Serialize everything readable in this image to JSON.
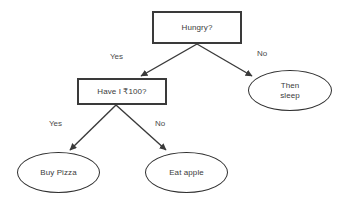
{
  "diagram": {
    "type": "decision-flowchart",
    "background_color": "#ffffff",
    "stroke_color": "#3a3a3a",
    "text_color": "#3b3b3b",
    "nodes": [
      {
        "id": "hungry",
        "shape": "rectangle",
        "label": "Hungry?"
      },
      {
        "id": "money",
        "shape": "rectangle",
        "label": "Have I ₹100?"
      },
      {
        "id": "sleep",
        "shape": "ellipse",
        "label": "Then\nsleep"
      },
      {
        "id": "pizza",
        "shape": "ellipse",
        "label": "Buy Pizza"
      },
      {
        "id": "apple",
        "shape": "ellipse",
        "label": "Eat apple"
      }
    ],
    "edges": [
      {
        "id": "hungry-yes",
        "from": "hungry",
        "to": "money",
        "label": "Yes"
      },
      {
        "id": "hungry-no",
        "from": "hungry",
        "to": "sleep",
        "label": "No"
      },
      {
        "id": "money-yes",
        "from": "money",
        "to": "pizza",
        "label": "Yes"
      },
      {
        "id": "money-no",
        "from": "money",
        "to": "apple",
        "label": "No"
      }
    ]
  }
}
